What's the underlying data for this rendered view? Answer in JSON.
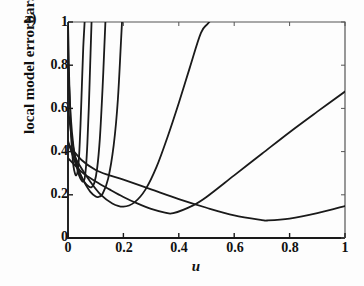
{
  "figure": {
    "panel_label": "a)",
    "background_color": "#fdfdfd",
    "ink_color": "#1a1a1a"
  },
  "chart_data": {
    "type": "line",
    "title": "",
    "subtitle": "",
    "panel": "a)",
    "xlabel": "u",
    "ylabel": "local model errorbars",
    "xlim": [
      0,
      1
    ],
    "ylim": [
      0,
      1
    ],
    "xticks": [
      0,
      0.2,
      0.4,
      0.6,
      0.8,
      1
    ],
    "xticklabels": [
      "0",
      "0.2",
      "0.4",
      "0.6",
      "0.8",
      "1"
    ],
    "yticks": [
      0,
      0.2,
      0.4,
      0.6,
      0.8,
      1
    ],
    "yticklabels": [
      "0",
      "0.2",
      "0.4",
      "0.6",
      "0.8",
      "1"
    ],
    "grid": false,
    "legend": null,
    "legend_position": "none",
    "annotations": [],
    "series": [
      {
        "name": "curve-1",
        "comment": "narrowest U, minimum near u=0.03",
        "x": [
          0.0,
          0.005,
          0.01,
          0.015,
          0.02,
          0.025,
          0.03,
          0.035,
          0.04,
          0.045,
          0.05,
          0.055,
          0.06
        ],
        "y": [
          1.0,
          0.7,
          0.5,
          0.4,
          0.33,
          0.3,
          0.29,
          0.31,
          0.38,
          0.52,
          0.7,
          0.88,
          1.0
        ]
      },
      {
        "name": "curve-2",
        "comment": "narrow U, minimum near u=0.055",
        "x": [
          0.0,
          0.01,
          0.02,
          0.03,
          0.04,
          0.05,
          0.055,
          0.06,
          0.065,
          0.07,
          0.075,
          0.08,
          0.085
        ],
        "y": [
          0.82,
          0.56,
          0.42,
          0.34,
          0.29,
          0.265,
          0.262,
          0.275,
          0.33,
          0.44,
          0.6,
          0.8,
          1.0
        ]
      },
      {
        "name": "curve-3",
        "comment": "U with minimum near u=0.085",
        "x": [
          0.0,
          0.015,
          0.03,
          0.045,
          0.06,
          0.075,
          0.085,
          0.095,
          0.105,
          0.115,
          0.125,
          0.135
        ],
        "y": [
          0.6,
          0.45,
          0.355,
          0.295,
          0.258,
          0.238,
          0.235,
          0.255,
          0.32,
          0.46,
          0.7,
          1.0
        ]
      },
      {
        "name": "curve-4",
        "comment": "U with minimum near u=0.11",
        "x": [
          0.0,
          0.02,
          0.04,
          0.06,
          0.08,
          0.1,
          0.11,
          0.125,
          0.145,
          0.165,
          0.18,
          0.195
        ],
        "y": [
          0.45,
          0.37,
          0.305,
          0.255,
          0.215,
          0.192,
          0.19,
          0.205,
          0.275,
          0.43,
          0.64,
          1.0
        ]
      },
      {
        "name": "curve-5",
        "comment": "broad U, minimum near u=0.20, y=0.145",
        "x": [
          0.0,
          0.04,
          0.08,
          0.12,
          0.16,
          0.2,
          0.24,
          0.28,
          0.32,
          0.36,
          0.4,
          0.44,
          0.48,
          0.51
        ],
        "y": [
          0.44,
          0.34,
          0.262,
          0.198,
          0.16,
          0.145,
          0.165,
          0.225,
          0.33,
          0.47,
          0.625,
          0.79,
          0.95,
          1.0
        ]
      },
      {
        "name": "curve-6",
        "comment": "broad shallow U, minimum near u=0.38, rising to 0.68 at u=1",
        "x": [
          0.0,
          0.05,
          0.1,
          0.15,
          0.2,
          0.25,
          0.3,
          0.35,
          0.38,
          0.45,
          0.5,
          0.6,
          0.7,
          0.8,
          0.9,
          1.0
        ],
        "y": [
          0.37,
          0.305,
          0.262,
          0.225,
          0.19,
          0.16,
          0.135,
          0.118,
          0.115,
          0.15,
          0.19,
          0.29,
          0.39,
          0.49,
          0.585,
          0.678
        ]
      },
      {
        "name": "curve-7",
        "comment": "flattest U, minimum near u=0.72, y=0.08",
        "x": [
          0.0,
          0.05,
          0.1,
          0.15,
          0.2,
          0.3,
          0.4,
          0.5,
          0.6,
          0.7,
          0.72,
          0.8,
          0.9,
          1.0
        ],
        "y": [
          0.435,
          0.36,
          0.315,
          0.29,
          0.27,
          0.225,
          0.18,
          0.14,
          0.105,
          0.083,
          0.081,
          0.09,
          0.115,
          0.148
        ]
      }
    ]
  }
}
